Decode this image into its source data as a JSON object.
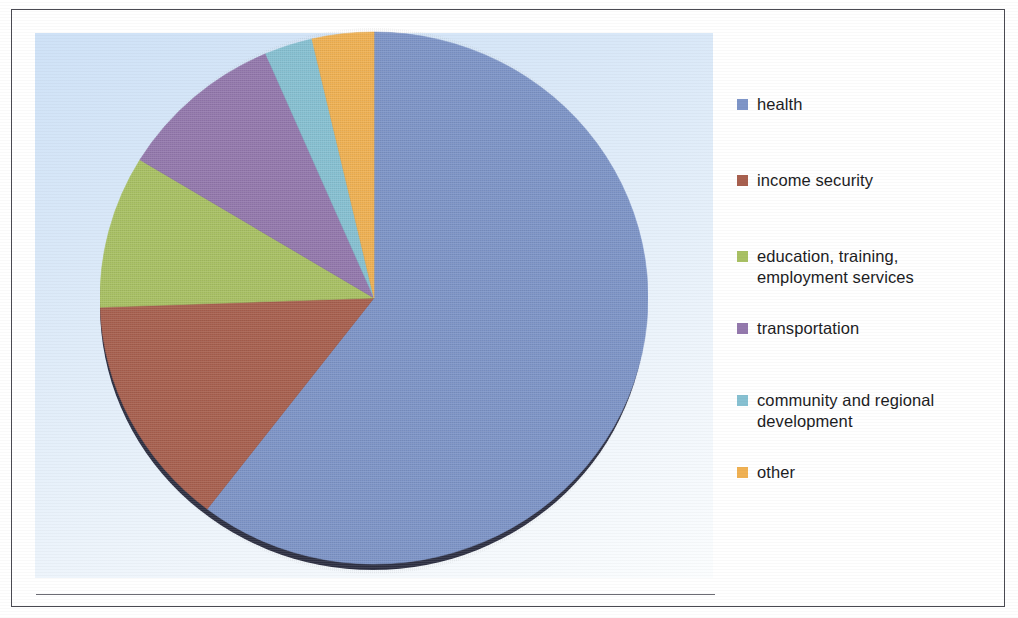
{
  "figure": {
    "background_color": "#ffffff",
    "frame_color": "#4a4a52",
    "plot_background_top": "#cfe2f7",
    "plot_background_bottom": "#fbfdfe",
    "baseline_color": "#6c6c74"
  },
  "chart_data": {
    "type": "pie",
    "title": "",
    "subtitle": "",
    "xlabel": "",
    "ylabel": "",
    "grid": false,
    "legend_position": "right",
    "start_angle_deg": 0,
    "direction": "clockwise",
    "categories": [
      "health",
      "income security",
      "education, training,\nemployment services",
      "transportation",
      "community and regional\ndevelopment",
      "other"
    ],
    "values": [
      60.4,
      14.0,
      9.3,
      9.8,
      2.8,
      3.6
    ],
    "units": "percent",
    "angles_deg": [
      217.5,
      50.5,
      33.3,
      35.4,
      10.2,
      13.1
    ],
    "colors": [
      "#7e95c8",
      "#a8604f",
      "#a9c164",
      "#9479ad",
      "#87c1d2",
      "#f0b153"
    ],
    "annotations": []
  },
  "legend": {
    "items": [
      {
        "label": "health",
        "color": "#7e95c8"
      },
      {
        "label": "income security",
        "color": "#a8604f"
      },
      {
        "label": "education, training,\nemployment services",
        "color": "#a9c164"
      },
      {
        "label": "transportation",
        "color": "#9479ad"
      },
      {
        "label": "community and regional\ndevelopment",
        "color": "#87c1d2"
      },
      {
        "label": "other",
        "color": "#f0b153"
      }
    ]
  }
}
